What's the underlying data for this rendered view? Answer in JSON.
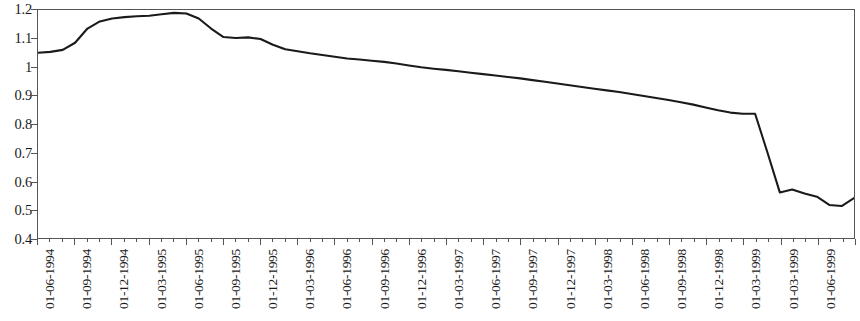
{
  "chart_data": {
    "type": "line",
    "title": "",
    "subtitle": "",
    "xlabel": "",
    "ylabel": "",
    "grid": false,
    "legend": null,
    "ylim": [
      0.4,
      1.2
    ],
    "ytick_labels": [
      "1.2",
      "1.1",
      "1",
      "0.9",
      "0.8",
      "0.7",
      "0.6",
      "0.5",
      "0.4"
    ],
    "ytick_values": [
      1.2,
      1.1,
      1.0,
      0.9,
      0.8,
      0.7,
      0.6,
      0.5,
      0.4
    ],
    "xtick_labels": [
      "01-06-1994",
      "01-09-1994",
      "01-12-1994",
      "01-03-1995",
      "01-06-1995",
      "01-09-1995",
      "01-12-1995",
      "01-03-1996",
      "01-06-1996",
      "01-09-1996",
      "01-12-1996",
      "01-03-1997",
      "01-06-1997",
      "01-09-1997",
      "01-12-1997",
      "01-03-1998",
      "01-06-1998",
      "01-09-1998",
      "01-12-1998",
      "01-03-1999",
      "01-03-1999",
      "01-06-1999",
      "01-09-1999",
      "01-12-1999"
    ],
    "x": [
      "01-06-1994",
      "01-07-1994",
      "01-08-1994",
      "01-09-1994",
      "01-10-1994",
      "01-11-1994",
      "01-12-1994",
      "01-01-1995",
      "01-02-1995",
      "01-03-1995",
      "01-04-1995",
      "01-05-1995",
      "01-06-1995",
      "01-07-1995",
      "01-08-1995",
      "01-09-1995",
      "01-10-1995",
      "01-11-1995",
      "01-12-1995",
      "01-01-1996",
      "01-02-1996",
      "01-03-1996",
      "01-04-1996",
      "01-05-1996",
      "01-06-1996",
      "01-07-1996",
      "01-08-1996",
      "01-09-1996",
      "01-10-1996",
      "01-11-1996",
      "01-12-1996",
      "01-01-1997",
      "01-02-1997",
      "01-03-1997",
      "01-04-1997",
      "01-05-1997",
      "01-06-1997",
      "01-07-1997",
      "01-08-1997",
      "01-09-1997",
      "01-10-1997",
      "01-11-1997",
      "01-12-1997",
      "01-01-1998",
      "01-02-1998",
      "01-03-1998",
      "01-04-1998",
      "01-05-1998",
      "01-06-1998",
      "01-07-1998",
      "01-08-1998",
      "01-09-1998",
      "01-10-1998",
      "01-11-1998",
      "01-12-1998",
      "01-01-1999",
      "01-02-1999",
      "01-03-1999",
      "01-04-1999",
      "01-05-1999",
      "01-06-1999",
      "01-07-1999",
      "01-08-1999",
      "01-09-1999",
      "01-10-1999",
      "01-11-1999",
      "01-12-1999"
    ],
    "values": [
      1.05,
      1.053,
      1.06,
      1.085,
      1.135,
      1.16,
      1.17,
      1.175,
      1.178,
      1.18,
      1.185,
      1.19,
      1.188,
      1.17,
      1.135,
      1.105,
      1.102,
      1.104,
      1.098,
      1.078,
      1.062,
      1.055,
      1.048,
      1.042,
      1.036,
      1.03,
      1.026,
      1.022,
      1.018,
      1.012,
      1.005,
      0.999,
      0.994,
      0.99,
      0.985,
      0.98,
      0.975,
      0.97,
      0.965,
      0.96,
      0.954,
      0.948,
      0.942,
      0.936,
      0.93,
      0.924,
      0.918,
      0.912,
      0.905,
      0.898,
      0.891,
      0.884,
      0.876,
      0.868,
      0.858,
      0.848,
      0.84,
      0.836,
      0.836,
      0.7,
      0.56,
      0.522,
      0.52,
      0.56,
      0.585,
      0.59,
      0.58
    ],
    "series_tail": [
      {
        "x": "01-07-1999",
        "value": 0.57
      },
      {
        "x": "01-08-1999",
        "value": 0.556
      },
      {
        "x": "01-09-1999",
        "value": 0.545
      },
      {
        "x": "01-10-1999",
        "value": 0.516
      },
      {
        "x": "01-11-1999",
        "value": 0.512
      },
      {
        "x": "01-12-1999",
        "value": 0.54
      }
    ],
    "annotations": [
      {
        "label": "plateau",
        "value": 1.19,
        "x": "01-05-1995"
      },
      {
        "label": "sharp drop",
        "from": 0.836,
        "to": 0.52,
        "x": "01-01-1999"
      },
      {
        "label": "trough",
        "value": 0.52,
        "x": "01-04-1999"
      },
      {
        "label": "final",
        "value": 0.54,
        "x": "01-12-1999"
      }
    ]
  },
  "style": {
    "line_color": "#1a1a1a",
    "axis_color": "#555555",
    "background": "#ffffff",
    "text_color": "#1a1a1a"
  }
}
